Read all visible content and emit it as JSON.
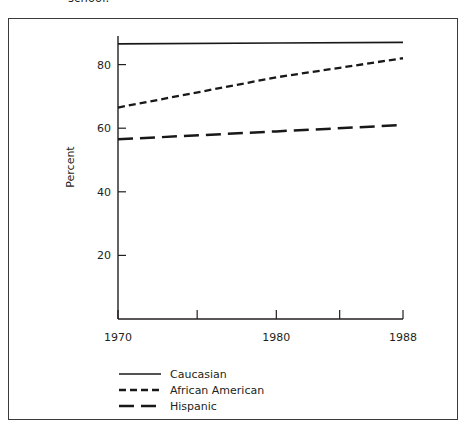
{
  "caption": {
    "text": "school."
  },
  "chart_data": {
    "type": "line",
    "title": "",
    "xlabel": "",
    "ylabel": "Percent",
    "xlim": [
      1970,
      1988
    ],
    "ylim": [
      0,
      90
    ],
    "grid": false,
    "legend_position": "bottom-left",
    "x": [
      1970,
      1980,
      1988
    ],
    "xtick_labels": [
      "1970",
      "",
      "1980",
      "",
      "1988"
    ],
    "xtick_values": [
      1970,
      1975,
      1980,
      1984,
      1988
    ],
    "ytick_labels": [
      "20",
      "40",
      "60",
      "80"
    ],
    "ytick_values": [
      20,
      40,
      60,
      80
    ],
    "series": [
      {
        "name": "Caucasian",
        "style": "solid",
        "values": [
          86.5,
          86.8,
          87.0
        ]
      },
      {
        "name": "African American",
        "style": "short-dash",
        "values": [
          66.5,
          76.0,
          82.0
        ]
      },
      {
        "name": "Hispanic",
        "style": "long-dash",
        "values": [
          56.5,
          59.0,
          61.0
        ]
      }
    ]
  },
  "legend": {
    "items": [
      {
        "label": "Caucasian",
        "style": "solid"
      },
      {
        "label": "African American",
        "style": "short-dash"
      },
      {
        "label": "Hispanic",
        "style": "long-dash"
      }
    ]
  },
  "colors": {
    "ink": "#231f20",
    "frame": "#3b3b3d",
    "background": "#ffffff"
  }
}
